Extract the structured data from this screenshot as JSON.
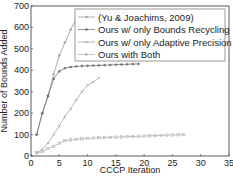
{
  "chart_data": {
    "type": "line",
    "title": "",
    "xlabel": "CCCP Iteration",
    "ylabel": "Number of Bounds Added",
    "xlim": [
      0,
      35
    ],
    "ylim": [
      0,
      700
    ],
    "xticks": [
      0,
      5,
      10,
      15,
      20,
      25,
      30,
      35
    ],
    "yticks": [
      0,
      100,
      200,
      300,
      400,
      500,
      600,
      700
    ],
    "grid": false,
    "legend_position": "upper right",
    "series": [
      {
        "name": "(Yu & Joachims, 2009)",
        "marker": "+",
        "x": [
          1,
          2,
          3,
          4,
          5,
          6,
          7,
          8
        ],
        "values": [
          100,
          200,
          280,
          380,
          470,
          530,
          590,
          640
        ]
      },
      {
        "name": "Ours w/ only Bounds Recycling",
        "marker": "*",
        "x": [
          1,
          2,
          3,
          4,
          5,
          6,
          7,
          8,
          9,
          10,
          11,
          12,
          13,
          14,
          15,
          16,
          17,
          18,
          19
        ],
        "values": [
          100,
          200,
          280,
          360,
          395,
          410,
          415,
          418,
          420,
          421,
          422,
          423,
          424,
          425,
          426,
          427,
          428,
          429,
          430
        ]
      },
      {
        "name": "Ours w/ only Adaptive Precision",
        "marker": "x",
        "x": [
          1,
          2,
          3,
          4,
          5,
          6,
          7,
          8,
          9,
          10,
          11,
          12
        ],
        "values": [
          15,
          30,
          60,
          100,
          140,
          185,
          220,
          260,
          300,
          330,
          345,
          365
        ]
      },
      {
        "name": "Ours with Both",
        "marker": "square",
        "x": [
          1,
          2,
          3,
          4,
          5,
          6,
          7,
          8,
          9,
          10,
          11,
          12,
          13,
          14,
          15,
          16,
          17,
          18,
          19,
          20,
          21,
          22,
          23,
          24,
          25,
          26,
          27
        ],
        "values": [
          15,
          20,
          35,
          45,
          60,
          72,
          75,
          78,
          80,
          82,
          84,
          85,
          86,
          87,
          88,
          89,
          90,
          91,
          92,
          93,
          94,
          95,
          96,
          97,
          98,
          99,
          100
        ]
      }
    ]
  }
}
